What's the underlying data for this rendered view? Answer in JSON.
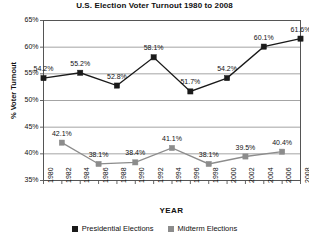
{
  "chart_data": {
    "type": "line",
    "title": "U.S. Election Voter Turnout 1980 to 2008",
    "xlabel": "YEAR",
    "ylabel": "% Voter Turnout",
    "ylim": [
      35,
      65
    ],
    "y_ticks": [
      "35%",
      "40%",
      "45%",
      "50%",
      "55%",
      "60%",
      "65%"
    ],
    "y_tick_values": [
      35,
      40,
      45,
      50,
      55,
      60,
      65
    ],
    "grid": true,
    "legend_position": "bottom",
    "x_ticks": [
      "1980",
      "1982",
      "1984",
      "1986",
      "1988",
      "1990",
      "1992",
      "1994",
      "1996",
      "1998",
      "2000",
      "2002",
      "2004",
      "2006",
      "2008"
    ],
    "series": [
      {
        "name": "Presidential Elections",
        "color": "#1a1a1a",
        "marker": "square",
        "x": [
          1980,
          1984,
          1988,
          1992,
          1996,
          2000,
          2004,
          2008
        ],
        "values": [
          54.2,
          55.2,
          52.8,
          58.1,
          51.7,
          54.2,
          60.1,
          61.6
        ],
        "labels": [
          "54.2%",
          "55.2%",
          "52.8%",
          "58.1%",
          "51.7%",
          "54.2%",
          "60.1%",
          "61.6%"
        ]
      },
      {
        "name": "Midterm Elections",
        "color": "#8c8c8c",
        "marker": "square",
        "x": [
          1982,
          1986,
          1990,
          1994,
          1998,
          2002,
          2006
        ],
        "values": [
          42.1,
          38.1,
          38.4,
          41.1,
          38.1,
          39.5,
          40.4
        ],
        "labels": [
          "42.1%",
          "38.1%",
          "38.4%",
          "41.1%",
          "38.1%",
          "39.5%",
          "40.4%"
        ]
      }
    ]
  },
  "legend": {
    "items": [
      {
        "label": "Presidential Elections",
        "color": "#1a1a1a"
      },
      {
        "label": "Midterm Elections",
        "color": "#8c8c8c"
      }
    ]
  }
}
